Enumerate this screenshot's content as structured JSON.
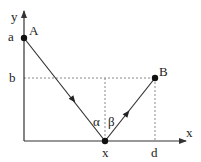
{
  "diagram": {
    "type": "reflection-path",
    "axes": {
      "x_label": "x",
      "y_label": "y"
    },
    "points": {
      "A": {
        "label": "A",
        "axis_label": "a"
      },
      "B": {
        "label": "B",
        "axis_label_y": "b",
        "axis_label_x": "d"
      },
      "X": {
        "label": "x"
      }
    },
    "angles": {
      "alpha": "α",
      "beta": "β"
    },
    "colors": {
      "line": "#333333",
      "dashed": "#888888",
      "point": "#111111"
    }
  }
}
